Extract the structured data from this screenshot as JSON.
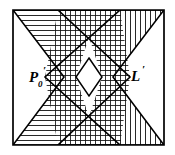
{
  "figure": {
    "width": 175,
    "height": 155,
    "background_color": "#ffffff",
    "stroke_color": "#000000",
    "stroke_width": 1.6,
    "hatch_color": "#1a1a1a",
    "hatch_width": 0.85,
    "hatch_spacing": 5
  },
  "labels": {
    "left_region": {
      "name": "P0-prime-label",
      "base": "P",
      "subscript": "0",
      "prime": "′",
      "full_text": "P₀′",
      "x": 34,
      "y": 80
    },
    "right_region": {
      "name": "L-prime-label",
      "base": "L",
      "prime": "′",
      "full_text": "L′",
      "x": 132,
      "y": 78
    }
  },
  "regions": [
    {
      "id": "left-region",
      "label": "P₀′",
      "hatch": "horizontal",
      "description": "Left bowtie region with horizontal hatching, concave notch opening to the left",
      "points": "13,10 120,10 45,77 120,145 13,145 64,77"
    },
    {
      "id": "right-region",
      "label": "L′",
      "hatch": "vertical",
      "description": "Right bowtie region with vertical hatching, concave notch opening to the right",
      "points": "164,10 58,10 130,77 58,145 164,145 113,77"
    },
    {
      "id": "overlap-region",
      "label": "",
      "hatch": "cross",
      "description": "Intersection of both bowties, cross-hatched grid",
      "points": "58,10 120,10 89,37 120,145 58,145 89,117 76,77 102,77"
    },
    {
      "id": "center-diamond",
      "label": "",
      "hatch": "none",
      "description": "Unhatched white diamond gap at the centre where the two notch vertices face each other",
      "points": "89,58 102,77 89,96 76,77"
    }
  ],
  "outline": {
    "name": "figure-outer-boundary",
    "description": "Outer trapezoidal boundary of the whole figure",
    "points": "13,10 164,10 164,145 13,145"
  }
}
